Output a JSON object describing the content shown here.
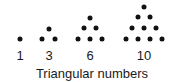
{
  "figure": {
    "caption": "Triangular numbers",
    "groups": [
      {
        "label": "1",
        "label_x": 20,
        "dots": [
          [
            20,
            39
          ]
        ]
      },
      {
        "label": "3",
        "label_x": 49,
        "dots": [
          [
            49,
            29
          ],
          [
            42,
            39
          ],
          [
            55,
            39
          ]
        ]
      },
      {
        "label": "6",
        "label_x": 90,
        "dots": [
          [
            90,
            18
          ],
          [
            84,
            28
          ],
          [
            96,
            28
          ],
          [
            78,
            39
          ],
          [
            90,
            39
          ],
          [
            102,
            39
          ]
        ]
      },
      {
        "label": "10",
        "label_x": 144,
        "dots": [
          [
            144,
            7
          ],
          [
            138,
            17
          ],
          [
            150,
            17
          ],
          [
            132,
            28
          ],
          [
            144,
            28
          ],
          [
            156,
            28
          ],
          [
            126,
            39
          ],
          [
            138,
            39
          ],
          [
            150,
            39
          ],
          [
            162,
            39
          ]
        ]
      }
    ],
    "dot_color": "#111111",
    "text_color": "#1a1a1a"
  }
}
